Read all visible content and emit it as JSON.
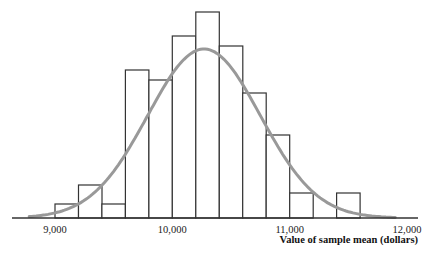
{
  "chart_data": {
    "type": "bar",
    "subtype": "histogram_with_normal_curve",
    "title": "",
    "xlabel": "Value of sample mean (dollars)",
    "ylabel": "",
    "xlim": [
      8700,
      12100
    ],
    "bin_width": 200,
    "bins": [
      {
        "start": 9000,
        "end": 9200,
        "relative_height": 14
      },
      {
        "start": 9200,
        "end": 9400,
        "relative_height": 33
      },
      {
        "start": 9400,
        "end": 9600,
        "relative_height": 14
      },
      {
        "start": 9600,
        "end": 9800,
        "relative_height": 148
      },
      {
        "start": 9800,
        "end": 10000,
        "relative_height": 138
      },
      {
        "start": 10000,
        "end": 10200,
        "relative_height": 182
      },
      {
        "start": 10200,
        "end": 10400,
        "relative_height": 206
      },
      {
        "start": 10400,
        "end": 10600,
        "relative_height": 172
      },
      {
        "start": 10600,
        "end": 10800,
        "relative_height": 125
      },
      {
        "start": 10800,
        "end": 11000,
        "relative_height": 83
      },
      {
        "start": 11000,
        "end": 11200,
        "relative_height": 25
      },
      {
        "start": 11200,
        "end": 11400,
        "relative_height": 0
      },
      {
        "start": 11400,
        "end": 11600,
        "relative_height": 25
      }
    ],
    "x_ticks": [
      {
        "value": 9000,
        "label": "9,000"
      },
      {
        "value": 10000,
        "label": "10,000"
      },
      {
        "value": 11000,
        "label": "11,000"
      },
      {
        "value": 12000,
        "label": "12,000"
      }
    ],
    "normal_curve": {
      "mean": 10270,
      "sd": 480,
      "peak_relative_height": 169,
      "color": "#999999"
    },
    "grid": false,
    "legend": null,
    "colors": {
      "bar_fill": "#ffffff",
      "bar_stroke": "#333333",
      "axis": "#333333",
      "curve": "#999999"
    }
  }
}
